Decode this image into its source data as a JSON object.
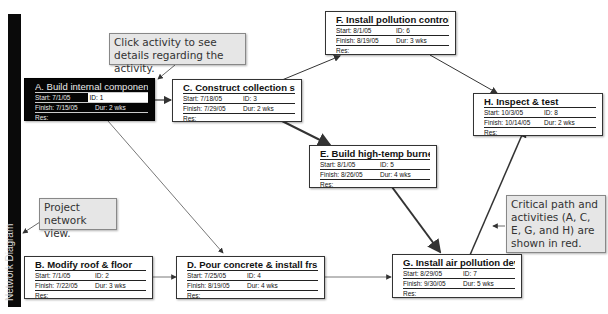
{
  "sidebar": {
    "label": "Network Diagram"
  },
  "callouts": {
    "click_activity": "Click activity to see details regarding the activity.",
    "project_view": "Project network view.",
    "critical_path": "Critical path and activities (A, C, E, G, and H) are shown in red."
  },
  "labels": {
    "start": "Start:",
    "finish": "Finish:",
    "id": "ID:",
    "dur": "Dur:",
    "res": "Res:"
  },
  "colors": {
    "selected_bg": "#050505",
    "node_bg": "#ffffff",
    "callout_bg": "#e6e6e6",
    "sidebar": "#0a0a0a"
  },
  "nodes": [
    {
      "key": "A",
      "title": "A. Build internal component:",
      "start": "7/1/05",
      "finish": "7/15/05",
      "id": "1",
      "dur": "2 wks",
      "res": "",
      "selected": true,
      "critical": true
    },
    {
      "key": "B",
      "title": "B. Modify roof & floor",
      "start": "7/1/05",
      "finish": "7/22/05",
      "id": "2",
      "dur": "3 wks",
      "res": "",
      "critical": false
    },
    {
      "key": "C",
      "title": "C. Construct collection stack",
      "start": "7/18/05",
      "finish": "7/29/05",
      "id": "3",
      "dur": "2 wks",
      "res": "",
      "critical": true
    },
    {
      "key": "D",
      "title": "D. Pour concrete & install frs",
      "start": "7/25/05",
      "finish": "8/19/05",
      "id": "4",
      "dur": "4 wks",
      "res": "",
      "critical": false
    },
    {
      "key": "E",
      "title": "E. Build high-temp burner",
      "start": "8/1/05",
      "finish": "8/26/05",
      "id": "5",
      "dur": "4 wks",
      "res": "",
      "critical": true
    },
    {
      "key": "F",
      "title": "F. Install pollution control s;",
      "start": "8/1/05",
      "finish": "8/19/05",
      "id": "6",
      "dur": "3 wks",
      "res": "",
      "critical": false
    },
    {
      "key": "G",
      "title": "G. Install air pollution device",
      "start": "8/29/05",
      "finish": "9/30/05",
      "id": "7",
      "dur": "5 wks",
      "res": "",
      "critical": true
    },
    {
      "key": "H",
      "title": "H. Inspect & test",
      "start": "10/3/05",
      "finish": "10/14/05",
      "id": "8",
      "dur": "2 wks",
      "res": "",
      "critical": true
    }
  ],
  "edges": [
    {
      "from": "A",
      "to": "C"
    },
    {
      "from": "A",
      "to": "D"
    },
    {
      "from": "B",
      "to": "D"
    },
    {
      "from": "C",
      "to": "F"
    },
    {
      "from": "C",
      "to": "E"
    },
    {
      "from": "D",
      "to": "G"
    },
    {
      "from": "E",
      "to": "G"
    },
    {
      "from": "F",
      "to": "H"
    },
    {
      "from": "G",
      "to": "H"
    }
  ]
}
